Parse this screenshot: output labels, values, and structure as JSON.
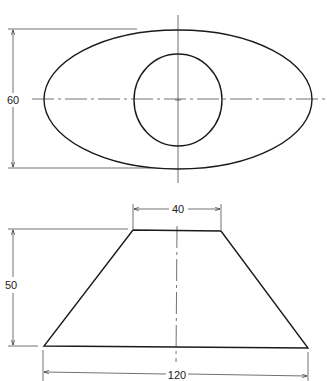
{
  "drawing": {
    "type": "orthographic-projection",
    "views": [
      {
        "name": "top-view",
        "shapes": [
          "outer-ellipse",
          "inner-circle"
        ],
        "dimensions": [
          {
            "label": "60",
            "orientation": "vertical",
            "describes": "ellipse minor axis height"
          }
        ]
      },
      {
        "name": "front-view",
        "shapes": [
          "trapezoid (frustum profile)"
        ],
        "dimensions": [
          {
            "label": "40",
            "orientation": "horizontal",
            "describes": "top width"
          },
          {
            "label": "50",
            "orientation": "vertical",
            "describes": "height"
          },
          {
            "label": "120",
            "orientation": "horizontal",
            "describes": "base width"
          }
        ]
      }
    ]
  },
  "labels": {
    "top_height": "60",
    "front_top_width": "40",
    "front_height": "50",
    "front_base_width": "120"
  },
  "colors": {
    "line": "#1a1a1a",
    "background": "#ffffff"
  }
}
